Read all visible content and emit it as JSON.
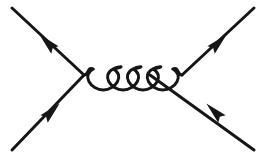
{
  "figure": {
    "subtype": "t-channel gluon exchange (Møller / quark scattering)",
    "background_color": "#ffffff",
    "line_color": "#161616",
    "width": 266,
    "height": 159
  },
  "chart_data": {
    "type": "diagram",
    "xlabel": "",
    "ylabel": "",
    "xlim": [
      0,
      266
    ],
    "ylim": [
      0,
      159
    ],
    "grid": false,
    "legend": "none",
    "vertices": [
      {
        "name": "left-vertex",
        "x": 84,
        "y": 75
      },
      {
        "name": "right-vertex",
        "x": 182,
        "y": 75
      }
    ],
    "series": [
      {
        "name": "incoming-fermion-lower-left",
        "kind": "fermion",
        "x": [
          12,
          84
        ],
        "y": [
          150,
          75
        ],
        "arrow_direction": "up-right",
        "arrow_at": {
          "x": 49,
          "y": 114
        }
      },
      {
        "name": "outgoing-fermion-upper-left",
        "kind": "fermion",
        "x": [
          84,
          12
        ],
        "y": [
          75,
          8
        ],
        "arrow_direction": "up-left",
        "arrow_at": {
          "x": 50,
          "y": 45
        }
      },
      {
        "name": "incoming-fermion-lower-right",
        "kind": "fermion",
        "x": [
          254,
          150
        ],
        "y": [
          150,
          75
        ],
        "arrow_direction": "up-left",
        "arrow_at": {
          "x": 217,
          "y": 114
        }
      },
      {
        "name": "outgoing-fermion-upper-right",
        "kind": "fermion",
        "x": [
          182,
          254
        ],
        "y": [
          75,
          8
        ],
        "arrow_direction": "up-right",
        "arrow_at": {
          "x": 216,
          "y": 45
        }
      },
      {
        "name": "exchanged-gluon",
        "kind": "gluon-spring",
        "x": [
          84,
          182
        ],
        "y": [
          75,
          75
        ],
        "loops": 4,
        "loop_top_y": 69,
        "loop_bottom_y": 90
      }
    ],
    "annotations": []
  },
  "elements": {
    "left_vertex_label": "left vertex",
    "right_vertex_label": "right vertex",
    "gluon_label": "gluon propagator",
    "incoming_lower_left_label": "incoming fermion (lower left)",
    "outgoing_upper_left_label": "outgoing fermion (upper left)",
    "incoming_lower_right_label": "incoming fermion (lower right)",
    "outgoing_upper_right_label": "outgoing fermion (upper right)"
  }
}
